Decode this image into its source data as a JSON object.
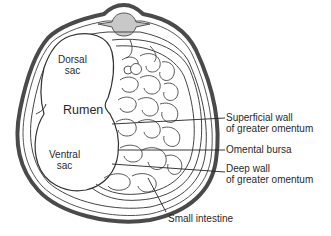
{
  "diagram": {
    "labels": {
      "dorsal_sac_line1": "Dorsal",
      "dorsal_sac_line2": "sac",
      "rumen": "Rumen",
      "ventral_sac_line1": "Ventral",
      "ventral_sac_line2": "sac",
      "superficial_wall_line1": "Superficial wall",
      "superficial_wall_line2": "of greater omentum",
      "omental_bursa": "Omental bursa",
      "deep_wall_line1": "Deep wall",
      "deep_wall_line2": "of greater omentum",
      "small_intestine": "Small intestine"
    },
    "colors": {
      "outline": "#3a3a3a",
      "body_wall": "#6e6e6e",
      "vertebra_fill": "#c8c8c8",
      "background": "#ffffff",
      "text": "#2a2a2a"
    }
  }
}
